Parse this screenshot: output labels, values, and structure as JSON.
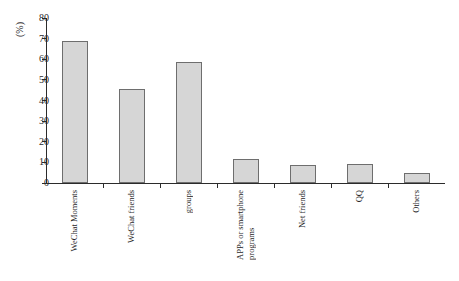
{
  "chart_data": {
    "type": "bar",
    "title": "",
    "subtitle": "",
    "xlabel": "",
    "ylabel": "(%)",
    "ylim": [
      0,
      80
    ],
    "ytick_step": 10,
    "yticks": [
      "80",
      "70",
      "60",
      "50",
      "40",
      "30",
      "20",
      "10",
      "0"
    ],
    "grid": false,
    "legend": "none",
    "categories": [
      "WeChat Moments",
      "WeChat friends",
      "groups",
      "APPs or smartphone programs",
      "Net friends",
      "QQ",
      "Others"
    ],
    "category_lines": [
      [
        "WeChat Moments"
      ],
      [
        "WeChat friends"
      ],
      [
        "groups"
      ],
      [
        "APPs or smartphone",
        "programs"
      ],
      [
        "Net friends"
      ],
      [
        "QQ"
      ],
      [
        "Others"
      ]
    ],
    "values": [
      69,
      45.5,
      58.5,
      11.5,
      8.5,
      9,
      5
    ],
    "bar_color": "#d6d6d6",
    "bar_border_color": "#6e6e6e",
    "axis_color": "#2b2b2b",
    "text_color": "#1f1f1f"
  }
}
